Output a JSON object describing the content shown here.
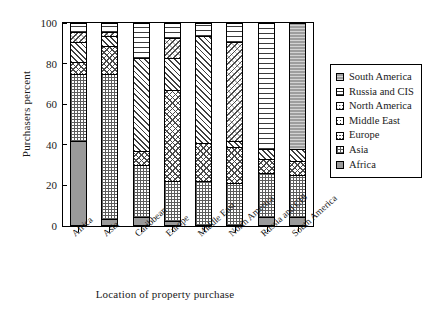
{
  "chart_data": {
    "type": "bar",
    "stacked": true,
    "title": "",
    "xlabel": "Location of property purchase",
    "ylabel": "Purchasers percent",
    "ylim": [
      0,
      100
    ],
    "yticks": [
      0,
      20,
      40,
      60,
      80,
      100
    ],
    "grid": false,
    "legend_position": "right",
    "categories": [
      "Africa",
      "Asia",
      "Caribbean",
      "Europe",
      "Middle East",
      "North America",
      "Russia and CIS",
      "South America"
    ],
    "series": [
      {
        "name": "Africa",
        "pattern": "solid-gray",
        "values": [
          42,
          3,
          4,
          2,
          0,
          0,
          4,
          4
        ]
      },
      {
        "name": "Asia",
        "pattern": "fine-grid",
        "values": [
          33,
          72,
          26,
          20,
          22,
          21,
          22,
          21
        ]
      },
      {
        "name": "Europe",
        "pattern": "cross-hatch",
        "values": [
          6,
          14,
          7,
          45,
          19,
          18,
          7,
          7
        ]
      },
      {
        "name": "Middle East",
        "pattern": "diagonal-hatch",
        "values": [
          10,
          5,
          46,
          16,
          53,
          3,
          5,
          6
        ]
      },
      {
        "name": "North America",
        "pattern": "dotted-diagonal",
        "values": [
          5,
          2,
          0,
          10,
          0,
          49,
          0,
          0
        ]
      },
      {
        "name": "Russia and CIS",
        "pattern": "horizontal-lines",
        "values": [
          4,
          4,
          17,
          7,
          6,
          9,
          62,
          0
        ]
      },
      {
        "name": "South America",
        "pattern": "gray-lines",
        "values": [
          0,
          0,
          0,
          0,
          0,
          0,
          0,
          62
        ]
      }
    ]
  },
  "legend": {
    "items": [
      {
        "label": "South America",
        "pattern": "gray-lines"
      },
      {
        "label": "Russia and CIS",
        "pattern": "horizontal-lines"
      },
      {
        "label": "North America",
        "pattern": "dotted-diagonal"
      },
      {
        "label": "Middle East",
        "pattern": "diagonal-hatch"
      },
      {
        "label": "Europe",
        "pattern": "cross-hatch"
      },
      {
        "label": "Asia",
        "pattern": "fine-grid"
      },
      {
        "label": "Africa",
        "pattern": "solid-gray"
      }
    ]
  }
}
